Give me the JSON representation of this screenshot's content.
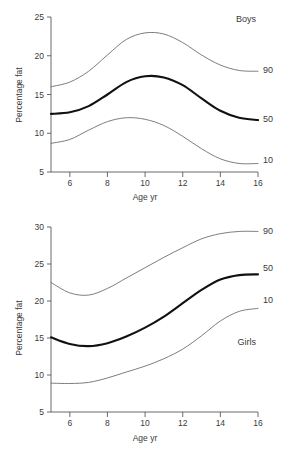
{
  "figure": {
    "panels": [
      "boys",
      "girls"
    ],
    "background_color": "#ffffff",
    "line_color_thin": "#6e6e6e",
    "line_color_thick": "#111111"
  },
  "chart_data": [
    {
      "type": "line",
      "title": "Boys",
      "panel_label": "Boys",
      "xlabel": "Age yr",
      "ylabel": "Percentage fat",
      "xlim": [
        5,
        16
      ],
      "ylim": [
        5,
        25
      ],
      "xticks": [
        6,
        8,
        10,
        12,
        14,
        16
      ],
      "yticks": [
        5,
        10,
        15,
        20,
        25
      ],
      "xtick_labels": [
        "6",
        "8",
        "10",
        "12",
        "14",
        "16"
      ],
      "ytick_labels": [
        "5",
        "10",
        "15",
        "20",
        "25"
      ],
      "grid": false,
      "legend_position": "right-of-axes",
      "x": [
        5,
        6,
        7,
        8,
        9,
        10,
        11,
        12,
        13,
        14,
        15,
        16
      ],
      "series": [
        {
          "name": "90",
          "label": "90",
          "style": "thin",
          "values": [
            16.0,
            16.6,
            18.0,
            20.1,
            22.1,
            22.95,
            22.8,
            21.7,
            20.1,
            18.8,
            18.1,
            18.0
          ]
        },
        {
          "name": "50",
          "label": "50",
          "style": "thick",
          "values": [
            12.5,
            12.7,
            13.5,
            15.0,
            16.6,
            17.35,
            17.2,
            16.2,
            14.5,
            12.9,
            12.0,
            11.7
          ]
        },
        {
          "name": "10",
          "label": "10",
          "style": "thin",
          "values": [
            8.7,
            9.2,
            10.4,
            11.5,
            12.0,
            11.8,
            11.0,
            9.6,
            8.0,
            6.7,
            6.1,
            6.1
          ]
        }
      ]
    },
    {
      "type": "line",
      "title": "Girls",
      "panel_label": "Girls",
      "xlabel": "Age yr",
      "ylabel": "Percentage fat",
      "xlim": [
        5,
        16
      ],
      "ylim": [
        5,
        30
      ],
      "xticks": [
        6,
        8,
        10,
        12,
        14,
        16
      ],
      "yticks": [
        5,
        10,
        15,
        20,
        25,
        30
      ],
      "xtick_labels": [
        "6",
        "8",
        "10",
        "12",
        "14",
        "16"
      ],
      "ytick_labels": [
        "5",
        "10",
        "15",
        "20",
        "25",
        "30"
      ],
      "grid": false,
      "legend_position": "right-of-axes",
      "x": [
        5,
        6,
        7,
        8,
        9,
        10,
        11,
        12,
        13,
        14,
        15,
        16
      ],
      "series": [
        {
          "name": "90",
          "label": "90",
          "style": "thin",
          "values": [
            22.5,
            21.1,
            20.8,
            21.7,
            23.1,
            24.5,
            25.9,
            27.2,
            28.4,
            29.1,
            29.4,
            29.4
          ]
        },
        {
          "name": "50",
          "label": "50",
          "style": "thick",
          "values": [
            15.1,
            14.2,
            13.9,
            14.3,
            15.2,
            16.4,
            17.9,
            19.7,
            21.5,
            22.9,
            23.5,
            23.6
          ]
        },
        {
          "name": "10",
          "label": "10",
          "style": "thin",
          "values": [
            8.9,
            8.85,
            9.0,
            9.6,
            10.4,
            11.2,
            12.2,
            13.5,
            15.3,
            17.3,
            18.6,
            19.0
          ]
        }
      ]
    }
  ]
}
